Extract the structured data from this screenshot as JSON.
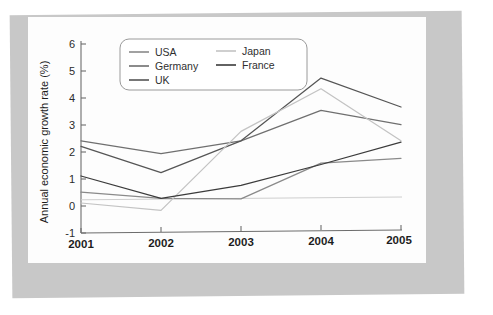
{
  "chart_data": {
    "type": "line",
    "title": "",
    "xlabel": "",
    "ylabel": "Annual economic growth rate (%)",
    "x": [
      "2001",
      "2002",
      "2003",
      "2004",
      "2005"
    ],
    "categories": [
      "2001",
      "2002",
      "2003",
      "2004",
      "2005"
    ],
    "xlim": [
      2001,
      2005
    ],
    "ylim": [
      -1,
      6
    ],
    "yticks": [
      "6",
      "5",
      "4",
      "3",
      "2",
      "1",
      "0",
      "-1"
    ],
    "ytick_values": [
      6,
      5,
      4,
      3,
      2,
      1,
      0,
      -1
    ],
    "grid": false,
    "legend_position": "top-left-inside",
    "series": [
      {
        "name": "USA",
        "color": "#8a8a8a",
        "values": [
          0.4,
          0.15,
          0.1,
          1.4,
          1.55
        ]
      },
      {
        "name": "Germany",
        "color": "#6f6f6f",
        "values": [
          2.3,
          1.8,
          2.25,
          3.35,
          2.8
        ]
      },
      {
        "name": "UK",
        "color": "#555555",
        "values": [
          2.1,
          1.1,
          2.25,
          4.55,
          3.45
        ]
      },
      {
        "name": "Japan",
        "color": "#c3c3c3",
        "values": [
          0.0,
          -0.3,
          2.6,
          4.15,
          2.2
        ]
      },
      {
        "name": "France",
        "color": "#3b3b3b",
        "values": [
          1.0,
          0.15,
          0.6,
          1.35,
          2.15
        ]
      }
    ],
    "reference_line": {
      "value": 0.12,
      "color": "#cfcfcf"
    }
  },
  "legend": {
    "entries": [
      {
        "label": "USA"
      },
      {
        "label": "Japan"
      },
      {
        "label": "Germany"
      },
      {
        "label": "France"
      },
      {
        "label": "UK"
      }
    ]
  },
  "colors": {
    "page_background": "#ffffff",
    "mount_border": "#c8c8c8",
    "panel_background": "#fdfdfd",
    "axis": "#6d6d6d",
    "text": "#1d1d1d"
  }
}
